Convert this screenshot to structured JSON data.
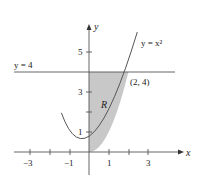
{
  "diagram": {
    "curve_label": "y = x²",
    "line_label": "y = 4",
    "point_label": "(2, 4)",
    "region_label": "R",
    "x_axis_label": "x",
    "y_axis_label": "y",
    "x_ticks": [
      "−3",
      "−1",
      "1",
      "3"
    ],
    "y_ticks": [
      "1",
      "3",
      "5"
    ],
    "colors": {
      "region_fill": "#c8c8c8",
      "stroke": "#555555"
    }
  }
}
